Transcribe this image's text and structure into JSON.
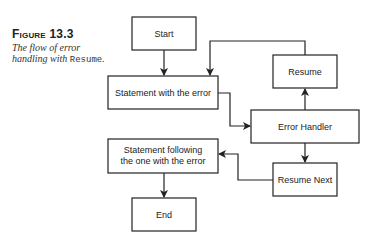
{
  "figure": {
    "label": "Figure 13.3",
    "caption_text": "The flow of error handling with",
    "caption_code": "Resume",
    "caption_end": "."
  },
  "nodes": {
    "start": {
      "label": "Start"
    },
    "statement_error": {
      "label": "Statement with the error"
    },
    "resume": {
      "label": "Resume"
    },
    "error_handler": {
      "label": "Error Handler"
    },
    "statement_following": {
      "line1": "Statement following",
      "line2": "the one with the error"
    },
    "resume_next": {
      "label": "Resume Next"
    },
    "end": {
      "label": "End"
    }
  },
  "edges": [
    {
      "from": "start",
      "to": "statement_error"
    },
    {
      "from": "statement_error",
      "to": "error_handler"
    },
    {
      "from": "error_handler",
      "to": "resume"
    },
    {
      "from": "resume",
      "to": "statement_error"
    },
    {
      "from": "error_handler",
      "to": "resume_next"
    },
    {
      "from": "resume_next",
      "to": "statement_following"
    },
    {
      "from": "statement_following",
      "to": "end"
    }
  ]
}
